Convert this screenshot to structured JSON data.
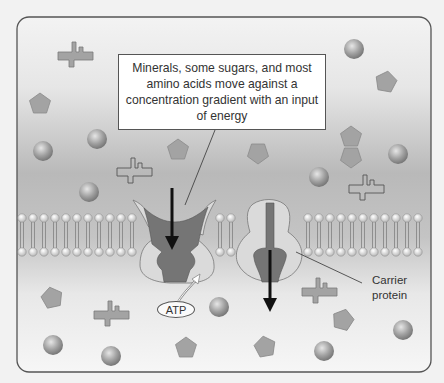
{
  "figure": {
    "type": "membrane-transport-diagram",
    "callout_text": "Minerals, some sugars, and most amino acids move against a concentration gradient with an input of energy",
    "labels": {
      "carrier_line1": "Carrier",
      "carrier_line2": "protein",
      "atp": "ATP"
    }
  },
  "colors": {
    "page_bg": "#f2f2f2",
    "panel_border": "#555555",
    "gradient_dark": "#b8b8b8",
    "gradient_light": "#f4f4f4",
    "protein_light": "#dcdcdc",
    "protein_dark": "#707070",
    "molecule_fill": "#9e9e9e",
    "arrow": "#111111"
  }
}
